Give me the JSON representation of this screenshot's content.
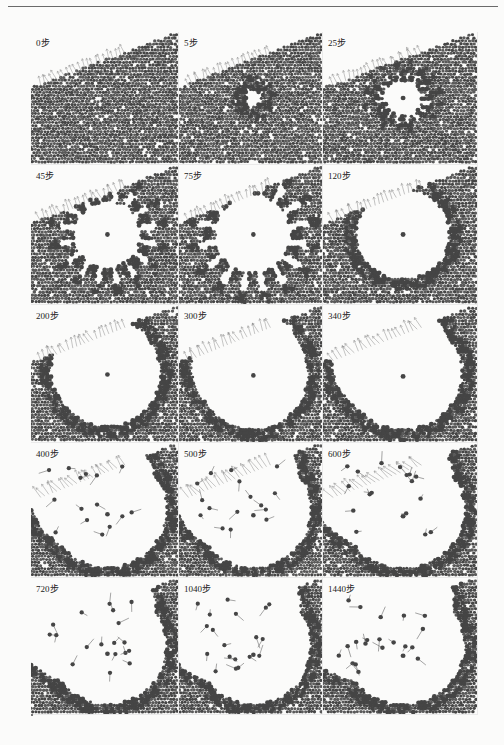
{
  "figure": {
    "grid": {
      "rows": 5,
      "cols": 3
    },
    "colors": {
      "particle": "#5a5a5a",
      "particle_dark": "#454545",
      "background": "#fbfbfa",
      "arrow": "#8a8a8a"
    },
    "panels": [
      {
        "label": "0步",
        "step": 0,
        "cavity": 0.0,
        "collapse": 0.0
      },
      {
        "label": "5步",
        "step": 5,
        "cavity": 0.05,
        "collapse": 0.0
      },
      {
        "label": "25步",
        "step": 25,
        "cavity": 0.12,
        "collapse": 0.0
      },
      {
        "label": "45步",
        "step": 45,
        "cavity": 0.22,
        "collapse": 0.0
      },
      {
        "label": "75步",
        "step": 75,
        "cavity": 0.26,
        "collapse": 0.0
      },
      {
        "label": "120步",
        "step": 120,
        "cavity": 0.3,
        "collapse": 0.0
      },
      {
        "label": "200步",
        "step": 200,
        "cavity": 0.36,
        "collapse": 0.1
      },
      {
        "label": "300步",
        "step": 300,
        "cavity": 0.38,
        "collapse": 0.2
      },
      {
        "label": "340步",
        "step": 340,
        "cavity": 0.38,
        "collapse": 0.3
      },
      {
        "label": "400步",
        "step": 400,
        "cavity": 0.4,
        "collapse": 0.45
      },
      {
        "label": "500步",
        "step": 500,
        "cavity": 0.4,
        "collapse": 0.55
      },
      {
        "label": "600步",
        "step": 600,
        "cavity": 0.4,
        "collapse": 0.65
      },
      {
        "label": "720步",
        "step": 720,
        "cavity": 0.4,
        "collapse": 0.8
      },
      {
        "label": "1040步",
        "step": 1040,
        "cavity": 0.4,
        "collapse": 0.9
      },
      {
        "label": "1440步",
        "step": 1440,
        "cavity": 0.4,
        "collapse": 1.0
      }
    ]
  }
}
